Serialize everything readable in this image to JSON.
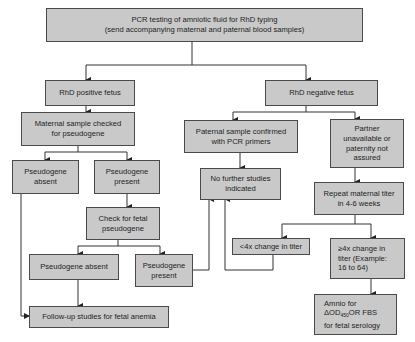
{
  "diagram": {
    "title_box": "PCR testing of amniotic fluid for RhD typing\n(send accompanying maternal and paternal blood samples)",
    "nodes": {
      "rhd_positive": "RhD positive fetus",
      "rhd_negative": "RhD negative fetus",
      "maternal_checked": "Maternal sample checked\nfor pseudogene",
      "pseudogene_absent_1": "Pseudogene\nabsent",
      "pseudogene_present_1": "Pseudogene\npresent",
      "check_fetal": "Check for fetal\npseudogene",
      "paternal_confirmed": "Paternal sample confirmed\nwith PCR primers",
      "partner_unavailable": "Partner\nunavailable or\npaternity not\nassured",
      "no_further": "No further studies\nindicated",
      "repeat_titer": "Repeat maternal titer\nin 4-6 weeks",
      "pseudogene_absent_2": "Pseudogene absent",
      "pseudogene_present_2": "Pseudogene\npresent",
      "less_4x": "<4x change in titer",
      "greater_4x": "≥4x change in\ntiter (Example:\n16 to 64)",
      "followup": "Follow-up studies for fetal anemia",
      "amnio_line1": "Amnio for",
      "amnio_delta": "ΔOD",
      "amnio_sub": "450",
      "amnio_line2_rest": "OR FBS",
      "amnio_line3": "for fetal serology"
    },
    "colors": {
      "box_fill": "#c9c9c9",
      "box_border": "#4a4a4a",
      "line": "#333333"
    }
  }
}
